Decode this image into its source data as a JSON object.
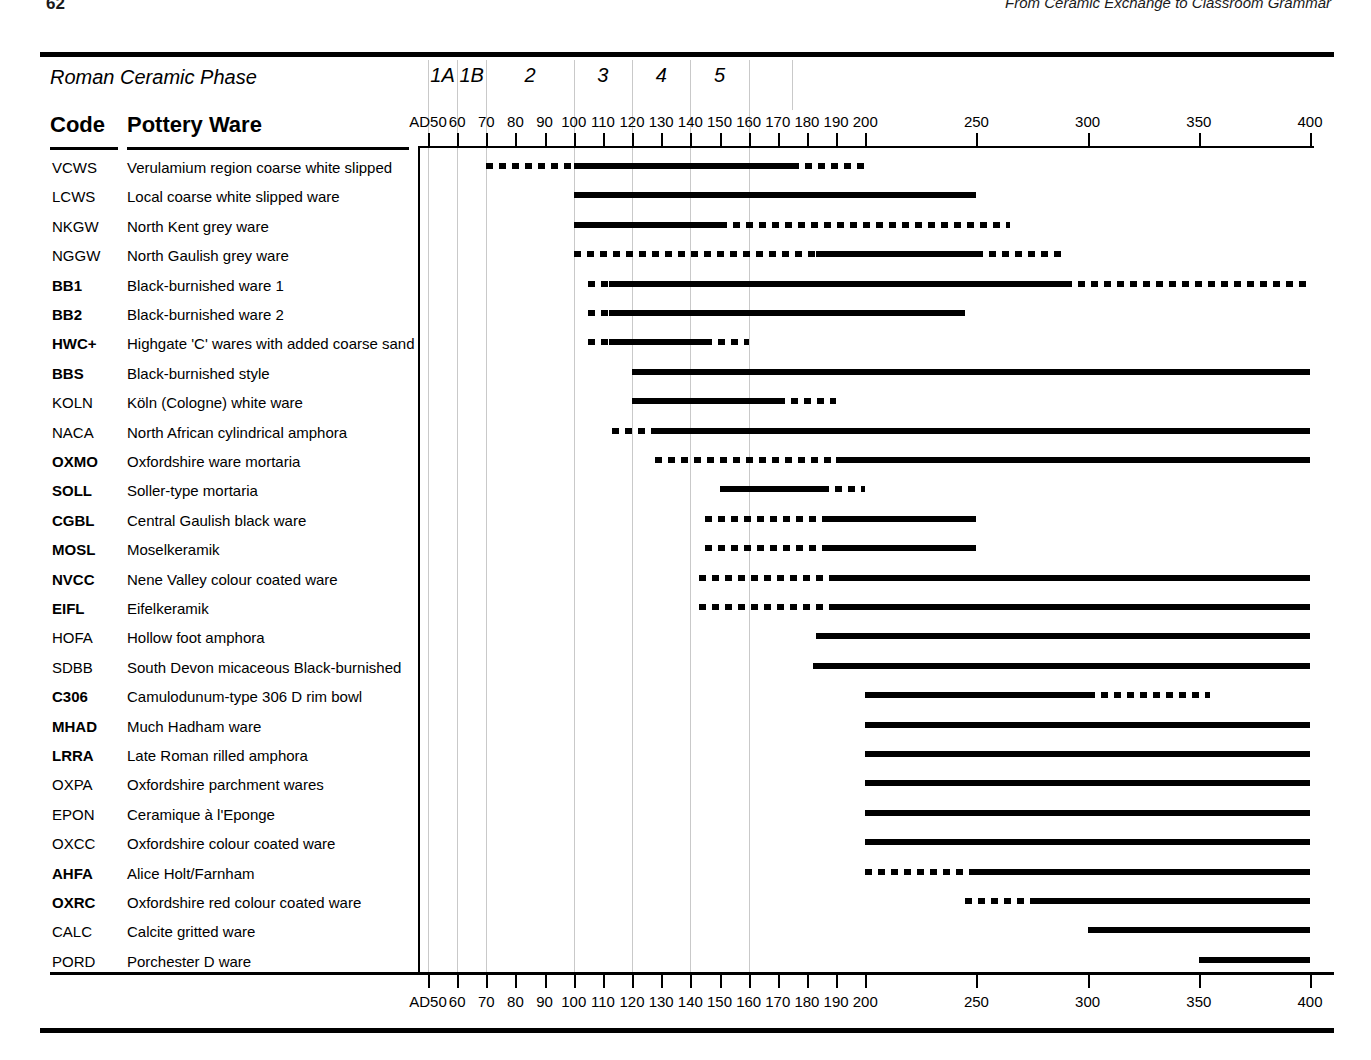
{
  "page": {
    "folio": "62",
    "running_head": "From Ceramic Exchange to Classroom Grammar"
  },
  "chart_header": {
    "phase_row_title": "Roman Ceramic Phase",
    "code_column_header": "Code",
    "ware_column_header": "Pottery Ware",
    "phases": [
      {
        "label": "1A",
        "start": 50,
        "end": 60
      },
      {
        "label": "1B",
        "start": 60,
        "end": 70
      },
      {
        "label": "2",
        "start": 70,
        "end": 100
      },
      {
        "label": "3",
        "start": 100,
        "end": 120
      },
      {
        "label": "4",
        "start": 120,
        "end": 140
      },
      {
        "label": "5",
        "start": 140,
        "end": 160
      }
    ],
    "phase_boundaries": [
      50,
      60,
      70,
      100,
      120,
      140,
      160
    ]
  },
  "chart_data": {
    "type": "bar",
    "xlabel": "Date AD",
    "ylabel": "Pottery ware",
    "grid": true,
    "legend_position": "none",
    "axis": {
      "ticks": [
        {
          "value": 50,
          "label": "AD50"
        },
        {
          "value": 60,
          "label": "60"
        },
        {
          "value": 70,
          "label": "70"
        },
        {
          "value": 80,
          "label": "80"
        },
        {
          "value": 90,
          "label": "90"
        },
        {
          "value": 100,
          "label": "100"
        },
        {
          "value": 110,
          "label": "110"
        },
        {
          "value": 120,
          "label": "120"
        },
        {
          "value": 130,
          "label": "130"
        },
        {
          "value": 140,
          "label": "140"
        },
        {
          "value": 150,
          "label": "150"
        },
        {
          "value": 160,
          "label": "160"
        },
        {
          "value": 170,
          "label": "170"
        },
        {
          "value": 180,
          "label": "180"
        },
        {
          "value": 190,
          "label": "190"
        },
        {
          "value": 200,
          "label": "200"
        },
        {
          "value": 250,
          "label": "250"
        },
        {
          "value": 300,
          "label": "300"
        },
        {
          "value": 350,
          "label": "350"
        },
        {
          "value": 400,
          "label": "400"
        }
      ],
      "xlim": [
        50,
        400
      ],
      "scale_note": "linear per decade 50-200, then compressed 50-year steps 200-400"
    },
    "columns": [
      "Code",
      "Pottery Ware",
      "Date range"
    ],
    "categories": [
      "VCWS",
      "LCWS",
      "NKGW",
      "NGGW",
      "BB1",
      "BB2",
      "HWC+",
      "BBS",
      "KOLN",
      "NACA",
      "OXMO",
      "SOLL",
      "CGBL",
      "MOSL",
      "NVCC",
      "EIFL",
      "HOFA",
      "SDBB",
      "C306",
      "MHAD",
      "LRRA",
      "OXPA",
      "EPON",
      "OXCC",
      "AHFA",
      "OXRC",
      "CALC",
      "PORD"
    ],
    "rows": [
      {
        "code": "VCWS",
        "bold": false,
        "ware": "Verulamium region coarse white slipped",
        "segments": [
          {
            "style": "dotted",
            "from": 70,
            "to": 100
          },
          {
            "style": "solid",
            "from": 100,
            "to": 175
          },
          {
            "style": "dotted",
            "from": 175,
            "to": 200
          }
        ]
      },
      {
        "code": "LCWS",
        "bold": false,
        "ware": "Local coarse white slipped ware",
        "segments": [
          {
            "style": "solid",
            "from": 100,
            "to": 250
          }
        ]
      },
      {
        "code": "NKGW",
        "bold": false,
        "ware": "North Kent grey ware",
        "segments": [
          {
            "style": "solid",
            "from": 100,
            "to": 150
          },
          {
            "style": "dotted",
            "from": 150,
            "to": 265
          }
        ]
      },
      {
        "code": "NGGW",
        "bold": false,
        "ware": "North Gaulish grey ware",
        "segments": [
          {
            "style": "dotted",
            "from": 100,
            "to": 183
          },
          {
            "style": "solid",
            "from": 183,
            "to": 250
          },
          {
            "style": "dotted",
            "from": 250,
            "to": 290
          }
        ]
      },
      {
        "code": "BB1",
        "bold": true,
        "ware": "Black-burnished ware 1",
        "segments": [
          {
            "style": "dotted",
            "from": 105,
            "to": 112
          },
          {
            "style": "solid",
            "from": 112,
            "to": 290
          },
          {
            "style": "dotted",
            "from": 290,
            "to": 400
          }
        ]
      },
      {
        "code": "BB2",
        "bold": true,
        "ware": "Black-burnished ware 2",
        "segments": [
          {
            "style": "dotted",
            "from": 105,
            "to": 112
          },
          {
            "style": "solid",
            "from": 112,
            "to": 245
          }
        ]
      },
      {
        "code": "HWC+",
        "bold": true,
        "ware": "Highgate 'C' wares with added coarse sand",
        "segments": [
          {
            "style": "dotted",
            "from": 105,
            "to": 112
          },
          {
            "style": "solid",
            "from": 112,
            "to": 145
          },
          {
            "style": "dotted",
            "from": 145,
            "to": 160
          }
        ]
      },
      {
        "code": "BBS",
        "bold": true,
        "ware": "Black-burnished style",
        "segments": [
          {
            "style": "solid",
            "from": 120,
            "to": 400
          }
        ]
      },
      {
        "code": "KOLN",
        "bold": false,
        "ware": "Köln (Cologne) white ware",
        "segments": [
          {
            "style": "solid",
            "from": 120,
            "to": 170
          },
          {
            "style": "dotted",
            "from": 170,
            "to": 190
          }
        ]
      },
      {
        "code": "NACA",
        "bold": false,
        "ware": "North African cylindrical amphora",
        "segments": [
          {
            "style": "dotted",
            "from": 113,
            "to": 127
          },
          {
            "style": "solid",
            "from": 127,
            "to": 400
          }
        ]
      },
      {
        "code": "OXMO",
        "bold": true,
        "ware": "Oxfordshire ware mortaria",
        "segments": [
          {
            "style": "dotted",
            "from": 128,
            "to": 190
          },
          {
            "style": "solid",
            "from": 190,
            "to": 400
          }
        ]
      },
      {
        "code": "SOLL",
        "bold": true,
        "ware": "Soller-type mortaria",
        "segments": [
          {
            "style": "solid",
            "from": 150,
            "to": 185
          },
          {
            "style": "dotted",
            "from": 185,
            "to": 200
          }
        ]
      },
      {
        "code": "CGBL",
        "bold": true,
        "ware": "Central Gaulish black ware",
        "segments": [
          {
            "style": "dotted",
            "from": 145,
            "to": 185
          },
          {
            "style": "solid",
            "from": 185,
            "to": 250
          }
        ]
      },
      {
        "code": "MOSL",
        "bold": true,
        "ware": "Moselkeramik",
        "segments": [
          {
            "style": "dotted",
            "from": 145,
            "to": 185
          },
          {
            "style": "solid",
            "from": 185,
            "to": 250
          }
        ]
      },
      {
        "code": "NVCC",
        "bold": true,
        "ware": "Nene Valley colour coated ware",
        "segments": [
          {
            "style": "dotted",
            "from": 143,
            "to": 190
          },
          {
            "style": "solid",
            "from": 190,
            "to": 400
          }
        ]
      },
      {
        "code": "EIFL",
        "bold": true,
        "ware": "Eifelkeramik",
        "segments": [
          {
            "style": "dotted",
            "from": 143,
            "to": 190
          },
          {
            "style": "solid",
            "from": 190,
            "to": 400
          }
        ]
      },
      {
        "code": "HOFA",
        "bold": false,
        "ware": "Hollow foot amphora",
        "segments": [
          {
            "style": "solid",
            "from": 183,
            "to": 400
          }
        ]
      },
      {
        "code": "SDBB",
        "bold": false,
        "ware": "South Devon micaceous Black-burnished",
        "segments": [
          {
            "style": "solid",
            "from": 182,
            "to": 400
          }
        ]
      },
      {
        "code": "C306",
        "bold": true,
        "ware": "Camulodunum-type 306 D rim bowl",
        "segments": [
          {
            "style": "solid",
            "from": 200,
            "to": 300
          },
          {
            "style": "dotted",
            "from": 300,
            "to": 355
          }
        ]
      },
      {
        "code": "MHAD",
        "bold": true,
        "ware": "Much Hadham ware",
        "segments": [
          {
            "style": "solid",
            "from": 200,
            "to": 400
          }
        ]
      },
      {
        "code": "LRRA",
        "bold": true,
        "ware": "Late Roman rilled amphora",
        "segments": [
          {
            "style": "solid",
            "from": 200,
            "to": 400
          }
        ]
      },
      {
        "code": "OXPA",
        "bold": false,
        "ware": "Oxfordshire parchment wares",
        "segments": [
          {
            "style": "solid",
            "from": 200,
            "to": 400
          }
        ]
      },
      {
        "code": "EPON",
        "bold": false,
        "ware": "Ceramique à l'Eponge",
        "segments": [
          {
            "style": "solid",
            "from": 200,
            "to": 400
          }
        ]
      },
      {
        "code": "OXCC",
        "bold": false,
        "ware": "Oxfordshire colour coated  ware",
        "segments": [
          {
            "style": "solid",
            "from": 200,
            "to": 400
          }
        ]
      },
      {
        "code": "AHFA",
        "bold": true,
        "ware": "Alice Holt/Farnham",
        "segments": [
          {
            "style": "dotted",
            "from": 200,
            "to": 250
          },
          {
            "style": "solid",
            "from": 250,
            "to": 400
          }
        ]
      },
      {
        "code": "OXRC",
        "bold": true,
        "ware": "Oxfordshire red colour coated  ware",
        "segments": [
          {
            "style": "dotted",
            "from": 245,
            "to": 275
          },
          {
            "style": "solid",
            "from": 275,
            "to": 400
          }
        ]
      },
      {
        "code": "CALC",
        "bold": false,
        "ware": "Calcite gritted ware",
        "segments": [
          {
            "style": "solid",
            "from": 300,
            "to": 400
          }
        ]
      },
      {
        "code": "PORD",
        "bold": false,
        "ware": "Porchester D ware",
        "segments": [
          {
            "style": "solid",
            "from": 350,
            "to": 400
          }
        ]
      }
    ]
  }
}
